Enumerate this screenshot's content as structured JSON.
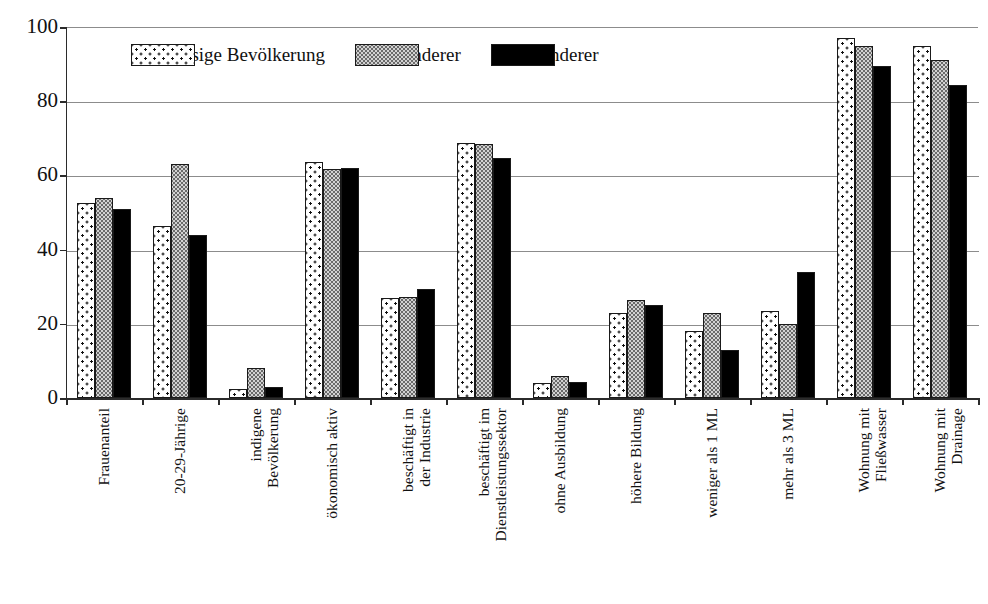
{
  "chart_data": {
    "type": "bar",
    "title": "",
    "xlabel": "",
    "ylabel": "",
    "ylim": [
      0,
      100
    ],
    "yticks": [
      0,
      20,
      40,
      60,
      80,
      100
    ],
    "grid": true,
    "legend_position": "top-center",
    "categories": [
      "Frauenanteil",
      "20-29-Jährige",
      "indigene\nBevölkerung",
      "ökonomisch aktiv",
      "beschäftigt in\nder Industrie",
      "beschäftigt im\nDienstleistungssektor",
      "ohne Ausbildung",
      "höhere Bildung",
      "weniger als 1 ML",
      "mehr als 3 ML",
      "Wohnung mit\nFließwasser",
      "Wohnung mit\nDrainage"
    ],
    "series": [
      {
        "name": "Ansässige Bevölkerung",
        "pattern": "white-with-dots",
        "values": [
          52.5,
          46.5,
          2.5,
          63.5,
          27.0,
          68.8,
          4.0,
          23.0,
          18.0,
          23.5,
          97.0,
          95.0
        ]
      },
      {
        "name": "Zuwanderer",
        "pattern": "gray-stipple",
        "values": [
          54.0,
          63.0,
          8.0,
          61.8,
          27.2,
          68.6,
          6.0,
          26.5,
          23.0,
          20.0,
          95.0,
          91.0
        ]
      },
      {
        "name": "Abwanderer",
        "pattern": "solid-black",
        "values": [
          51.0,
          44.0,
          3.0,
          62.0,
          29.5,
          64.8,
          4.3,
          25.2,
          13.0,
          34.0,
          89.5,
          84.5
        ]
      }
    ]
  },
  "colors": {
    "axis": "#2b2b2b",
    "grid": "#8c8c8c",
    "series_1_fill": "#ffffff",
    "series_2_fill": "#d2d2d2",
    "series_3_fill": "#000000",
    "text": "#111111"
  }
}
